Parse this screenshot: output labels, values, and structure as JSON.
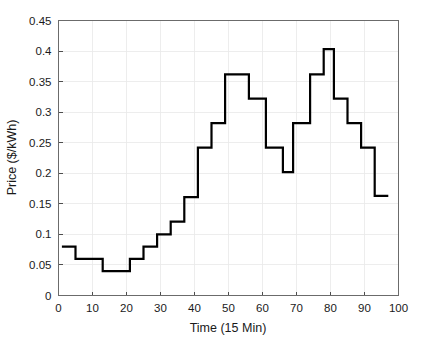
{
  "chart_data": {
    "type": "line",
    "title": "",
    "subtitle": "",
    "xlabel": "Time (15 Min)",
    "ylabel": "Price ($/kWh)",
    "xlim": [
      0,
      100
    ],
    "ylim": [
      0,
      0.45
    ],
    "xticks": [
      0,
      10,
      20,
      30,
      40,
      50,
      60,
      70,
      80,
      90,
      100
    ],
    "xtick_labels": [
      "0",
      "10",
      "20",
      "30",
      "40",
      "50",
      "60",
      "70",
      "80",
      "90",
      "100"
    ],
    "yticks": [
      0,
      0.05,
      0.1,
      0.15,
      0.2,
      0.25,
      0.3,
      0.35,
      0.4,
      0.45
    ],
    "ytick_labels": [
      "0",
      "0.05",
      "0.1",
      "0.15",
      "0.2",
      "0.25",
      "0.3",
      "0.35",
      "0.4",
      "0.45"
    ],
    "grid": true,
    "legend": null,
    "legend_position": "none",
    "line_style": "stairs",
    "line_color": "#000000",
    "line_width": 2.2,
    "series": [
      {
        "name": "Price",
        "x": [
          1,
          2,
          3,
          4,
          5,
          6,
          7,
          8,
          9,
          10,
          11,
          12,
          13,
          14,
          15,
          16,
          17,
          18,
          19,
          20,
          21,
          22,
          23,
          24,
          25,
          26,
          27,
          28,
          29,
          30,
          31,
          32,
          33,
          34,
          35,
          36,
          37,
          38,
          39,
          40,
          41,
          42,
          43,
          44,
          45,
          46,
          47,
          48,
          49,
          50,
          51,
          52,
          53,
          54,
          55,
          56,
          57,
          58,
          59,
          60,
          61,
          62,
          63,
          64,
          65,
          66,
          67,
          68,
          69,
          70,
          71,
          72,
          73,
          74,
          75,
          76,
          77,
          78,
          79,
          80,
          81,
          82,
          83,
          84,
          85,
          86,
          87,
          88,
          89,
          90,
          91,
          92,
          93,
          94,
          95,
          96
        ],
        "values": [
          0.08,
          0.08,
          0.08,
          0.08,
          0.06,
          0.06,
          0.06,
          0.06,
          0.06,
          0.06,
          0.06,
          0.06,
          0.04,
          0.04,
          0.04,
          0.04,
          0.04,
          0.04,
          0.04,
          0.04,
          0.06,
          0.06,
          0.06,
          0.06,
          0.08,
          0.08,
          0.08,
          0.08,
          0.1,
          0.1,
          0.1,
          0.1,
          0.121,
          0.121,
          0.121,
          0.121,
          0.161,
          0.161,
          0.161,
          0.161,
          0.242,
          0.242,
          0.242,
          0.242,
          0.282,
          0.282,
          0.282,
          0.282,
          0.362,
          0.362,
          0.362,
          0.362,
          0.362,
          0.362,
          0.362,
          0.322,
          0.322,
          0.322,
          0.322,
          0.322,
          0.242,
          0.242,
          0.242,
          0.242,
          0.242,
          0.202,
          0.202,
          0.202,
          0.282,
          0.282,
          0.282,
          0.282,
          0.282,
          0.362,
          0.362,
          0.362,
          0.362,
          0.403,
          0.403,
          0.403,
          0.322,
          0.322,
          0.322,
          0.322,
          0.282,
          0.282,
          0.282,
          0.282,
          0.242,
          0.242,
          0.242,
          0.242,
          0.163,
          0.163,
          0.163,
          0.163
        ]
      }
    ],
    "annotations": [],
    "notes": {
      "peak_1_value": 0.362,
      "peak_2_value": 0.403,
      "min_value": 0.04,
      "start_value": 0.08,
      "end_value": 0.163,
      "midday_dip_value": 0.202
    }
  }
}
